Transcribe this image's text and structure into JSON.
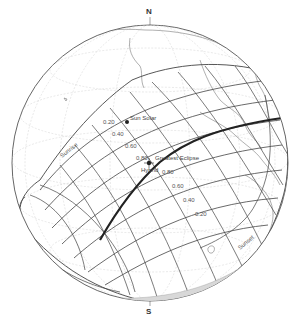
{
  "map": {
    "type": "orthographic-globe",
    "subject": "solar eclipse path",
    "north_label": "N",
    "south_label": "S",
    "points": {
      "sun_solar": "Sun Solar",
      "greatest_eclipse": "Greatest Eclipse",
      "hybrid": "Hybrid"
    },
    "magnitude_labels": [
      "0.20",
      "0.40",
      "0.60",
      "0.80",
      "0.80",
      "0.60",
      "0.40",
      "0.20"
    ],
    "time_labels": [
      "Sunrise",
      "Sunset"
    ],
    "colors": {
      "outline": "#555555",
      "grid": "#cfcfcf",
      "path": "#444444",
      "coast": "#777777",
      "central_line": "#222222"
    }
  }
}
